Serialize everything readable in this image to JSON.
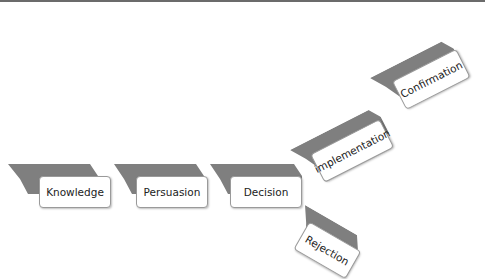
{
  "diagram": {
    "type": "process-flow",
    "ribbon_color": "#7f7f7f",
    "box_border_color": "#9a9a9a",
    "steps": [
      {
        "id": "knowledge",
        "label": "Knowledge"
      },
      {
        "id": "persuasion",
        "label": "Persuasion"
      },
      {
        "id": "decision",
        "label": "Decision"
      },
      {
        "id": "implementation",
        "label": "implementation"
      },
      {
        "id": "confirmation",
        "label": "Confirmation"
      },
      {
        "id": "rejection",
        "label": "Rejection"
      }
    ],
    "flow": [
      [
        "Knowledge",
        "Persuasion"
      ],
      [
        "Persuasion",
        "Decision"
      ],
      [
        "Decision",
        "implementation"
      ],
      [
        "implementation",
        "Confirmation"
      ],
      [
        "Decision",
        "Rejection"
      ]
    ]
  }
}
